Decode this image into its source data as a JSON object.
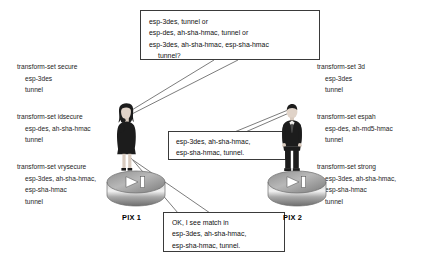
{
  "diagram": {
    "devices": [
      {
        "id": "pix1",
        "label": "PIX 1",
        "icon": "pix-firewall-icon",
        "person": "woman-figure"
      },
      {
        "id": "pix2",
        "label": "PIX 2",
        "icon": "pix-firewall-icon",
        "person": "man-figure"
      }
    ],
    "left_config": [
      {
        "name": "transform-set secure",
        "lines": [
          "esp-3des",
          "tunnel"
        ]
      },
      {
        "name": "transform-set idsecure",
        "lines": [
          "esp-des, ah-sha-hmac",
          "tunnel"
        ]
      },
      {
        "name": "transform-set vrysecure",
        "lines": [
          "esp-3des, ah-sha-hmac,",
          "esp-sha-hmac",
          "tunnel"
        ]
      }
    ],
    "right_config": [
      {
        "name": "transform-set 3d",
        "lines": [
          "esp-3des",
          "tunnel"
        ]
      },
      {
        "name": "transform-set espah",
        "lines": [
          "esp-des, ah-md5-hmac",
          "tunnel"
        ]
      },
      {
        "name": "transform-set strong",
        "lines": [
          "esp-3des, ah-sha-hmac,",
          "esp-sha-hmac",
          "tunnel"
        ]
      }
    ],
    "callouts": {
      "offer": {
        "id": "offer-callout",
        "lines": [
          {
            "text": "esp-3des, tunnel or",
            "indent": false
          },
          {
            "text": "esp-des, ah-sha-hmac, tunnel or",
            "indent": false
          },
          {
            "text": "esp-3des, ah-sha-hmac, esp-sha-hmac",
            "indent": false
          },
          {
            "text": "tunnel?",
            "indent": true
          }
        ]
      },
      "reply": {
        "id": "reply-callout",
        "lines": [
          {
            "text": "esp-3des, ah-sha-hmac,",
            "indent": false
          },
          {
            "text": "esp-sha-hmac, tunnel.",
            "indent": false
          }
        ]
      },
      "match": {
        "id": "match-callout",
        "lines": [
          {
            "text": "OK, I see match in",
            "indent": false
          },
          {
            "text": "esp-3des, ah-sha-hmac,",
            "indent": false
          },
          {
            "text": "esp-sha-hmac, tunnel.",
            "indent": false
          }
        ]
      }
    },
    "colors": {
      "background": "#ffffff",
      "text": "#1a1a1a",
      "box_border": "#3a3a3a",
      "leader_line": "#5a5a5a",
      "device_body": "#9a9a9a",
      "figure": "#1c1c1c"
    }
  }
}
